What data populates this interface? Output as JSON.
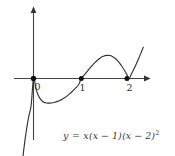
{
  "figure": {
    "background_color": "#ffffff",
    "curve_color": "#333333",
    "axis_color": "#444444",
    "point_color": "#111111"
  },
  "axes": {
    "x_axis_name": "x-axis",
    "y_axis_name": "y-axis",
    "arrowheads": "both-axes-positive-direction"
  },
  "labels": {
    "tick_0": "0",
    "tick_1": "1",
    "tick_2": "2"
  },
  "equation": {
    "lhs": "y",
    "equals": "=",
    "factor_1": "x",
    "factor_2": "(x − 1)",
    "factor_3": "(x − 2)",
    "exponent_3": "2",
    "full_text": "y = x(x − 1)(x − 2)²"
  },
  "chart_data": {
    "type": "line",
    "title": "",
    "subtitle": "",
    "xlabel": "",
    "ylabel": "",
    "function": "y = x(x - 1)(x - 2)^2",
    "degree": 4,
    "roots": [
      {
        "x": 0,
        "multiplicity": 1,
        "label": "0",
        "marked": true
      },
      {
        "x": 1,
        "multiplicity": 1,
        "label": "1",
        "marked": true
      },
      {
        "x": 2,
        "multiplicity": 2,
        "label": "2",
        "marked": true
      }
    ],
    "xlim": [
      -0.72,
      2.43
    ],
    "ylim": [
      -1.18,
      1.48
    ],
    "xticks": [
      0,
      1,
      2
    ],
    "xtick_labels": [
      "0",
      "1",
      "2"
    ],
    "yticks": [],
    "ytick_labels": [],
    "grid": false,
    "legend": false,
    "annotations": [
      {
        "text": "y = x(x − 1)(x − 2)²",
        "x": 0.63,
        "y": -1.03
      }
    ],
    "series": [
      {
        "name": "y = x(x-1)(x-2)^2",
        "color": "#333333",
        "x": [
          -0.34,
          -0.3,
          -0.25,
          -0.2,
          -0.15,
          -0.1,
          -0.05,
          0.0,
          0.05,
          0.1,
          0.15,
          0.2,
          0.25,
          0.3,
          0.35,
          0.4,
          0.45,
          0.5,
          0.55,
          0.6,
          0.65,
          0.7,
          0.75,
          0.8,
          0.85,
          0.9,
          0.95,
          1.0,
          1.05,
          1.1,
          1.15,
          1.2,
          1.25,
          1.3,
          1.35,
          1.4,
          1.45,
          1.5,
          1.55,
          1.6,
          1.65,
          1.7,
          1.75,
          1.8,
          1.85,
          1.9,
          1.95,
          2.0,
          2.05,
          2.1,
          2.15,
          2.2,
          2.25,
          2.3
        ],
        "y": [
          -2.453,
          -2.028,
          -1.582,
          -1.21,
          -0.905,
          -0.662,
          -0.474,
          0.0,
          -0.176,
          -0.292,
          -0.364,
          -0.403,
          -0.422,
          -0.429,
          -0.428,
          -0.422,
          -0.412,
          -0.398,
          -0.381,
          -0.36,
          -0.335,
          -0.306,
          -0.272,
          -0.235,
          -0.194,
          -0.149,
          -0.101,
          0.0,
          0.048,
          0.099,
          0.15,
          0.199,
          0.246,
          0.289,
          0.327,
          0.358,
          0.382,
          0.398,
          0.403,
          0.399,
          0.384,
          0.357,
          0.319,
          0.271,
          0.213,
          0.148,
          0.076,
          0.0,
          0.077,
          0.16,
          0.249,
          0.343,
          0.442,
          0.545
        ]
      }
    ],
    "local_extrema": [
      {
        "type": "local-minimum",
        "x": 0.31,
        "y": -0.43
      },
      {
        "type": "local-maximum",
        "x": 1.52,
        "y": 0.4
      },
      {
        "type": "local-minimum",
        "x": 2.0,
        "y": 0.0
      }
    ]
  }
}
